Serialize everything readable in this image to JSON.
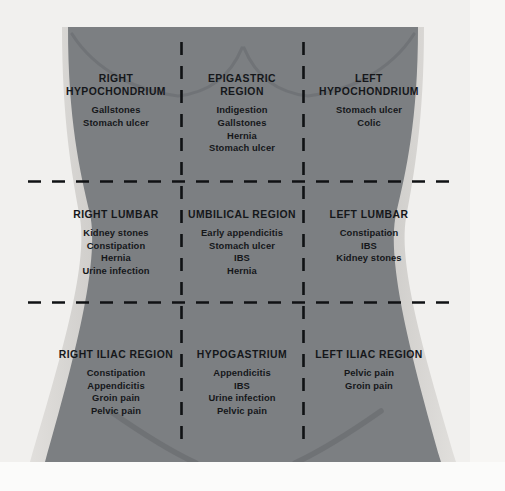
{
  "diagram": {
    "colors": {
      "background": "#f1f0ee",
      "body_fill": "#7c7f82",
      "body_edge_light": "#dcdbd8",
      "text": "#15171a",
      "dashed_line": "#101214"
    }
  },
  "regions": [
    {
      "id": "right-hypochondrium",
      "title": "RIGHT\nHYPOCHONDRIUM",
      "conditions": [
        "Gallstones",
        "Stomach ulcer"
      ]
    },
    {
      "id": "epigastric-region",
      "title": "EPIGASTRIC\nREGION",
      "conditions": [
        "Indigestion",
        "Gallstones",
        "Hernia",
        "Stomach ulcer"
      ]
    },
    {
      "id": "left-hypochondrium",
      "title": "LEFT\nHYPOCHONDRIUM",
      "conditions": [
        "Stomach ulcer",
        "Colic"
      ]
    },
    {
      "id": "right-lumbar",
      "title": "RIGHT LUMBAR",
      "conditions": [
        "Kidney stones",
        "Constipation",
        "Hernia",
        "Urine infection"
      ]
    },
    {
      "id": "umbilical-region",
      "title": "UMBILICAL REGION",
      "conditions": [
        "Early appendicitis",
        "Stomach ulcer",
        "IBS",
        "Hernia"
      ]
    },
    {
      "id": "left-lumbar",
      "title": "LEFT LUMBAR",
      "conditions": [
        "Constipation",
        "IBS",
        "Kidney stones"
      ]
    },
    {
      "id": "right-iliac-region",
      "title": "RIGHT ILIAC REGION",
      "conditions": [
        "Constipation",
        "Appendicitis",
        "Groin pain",
        "Pelvic pain"
      ]
    },
    {
      "id": "hypogastrium",
      "title": "HYPOGASTRIUM",
      "conditions": [
        "Appendicitis",
        "IBS",
        "Urine infection",
        "Pelvic pain"
      ]
    },
    {
      "id": "left-iliac-region",
      "title": "LEFT ILIAC REGION",
      "conditions": [
        "Pelvic pain",
        "Groin pain"
      ]
    }
  ]
}
